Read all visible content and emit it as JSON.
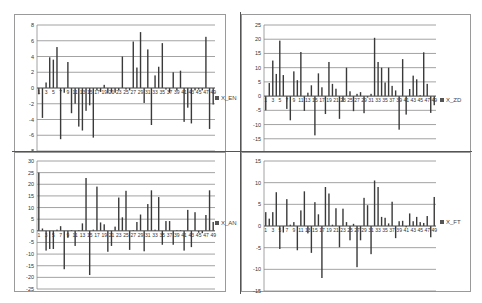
{
  "chart_data": [
    {
      "id": "x_en",
      "type": "bar",
      "title": "",
      "legend": "X_EN",
      "xlabel": "",
      "ylabel": "",
      "ylim": [
        -8,
        8
      ],
      "yticks": [
        -8,
        -6,
        -4,
        -2,
        0,
        2,
        4,
        6,
        8
      ],
      "grid": true,
      "legend_position": "right",
      "x_tick_labels": [
        "1",
        "3",
        "5",
        "7",
        "9",
        "11",
        "13",
        "15",
        "17",
        "19",
        "21",
        "23",
        "25",
        "27",
        "29",
        "31",
        "33",
        "35",
        "37",
        "39",
        "41",
        "43",
        "45",
        "47",
        "49"
      ],
      "categories": [
        1,
        2,
        3,
        4,
        5,
        6,
        7,
        8,
        9,
        10,
        11,
        12,
        13,
        14,
        15,
        16,
        17,
        18,
        19,
        20,
        21,
        22,
        23,
        24,
        25,
        26,
        27,
        28,
        29,
        30,
        31,
        32,
        33,
        34,
        35,
        36,
        37,
        38,
        39,
        40,
        41,
        42,
        43,
        44,
        45,
        46,
        47,
        48,
        49
      ],
      "values": [
        -0.8,
        -3.8,
        0.7,
        3.9,
        3.6,
        5.2,
        -6.5,
        -0.6,
        3.3,
        -3.2,
        -2.0,
        -4.9,
        -5.4,
        -2.9,
        -2.2,
        -6.3,
        -0.3,
        -0.5,
        0.4,
        -0.7,
        -0.6,
        -0.6,
        -0.3,
        4.0,
        -0.2,
        -0.3,
        5.9,
        2.6,
        7.1,
        -1.9,
        4.9,
        -4.7,
        1.6,
        2.7,
        5.7,
        -0.2,
        -0.6,
        2.0,
        -0.3,
        2.2,
        -4.3,
        -2.5,
        -4.5,
        -0.3,
        -0.2,
        -0.3,
        6.5,
        -5.2,
        -2.1
      ]
    },
    {
      "id": "x_zd",
      "type": "bar",
      "title": "",
      "legend": "X_ZD",
      "xlabel": "",
      "ylabel": "",
      "ylim": [
        -20,
        25
      ],
      "yticks": [
        -20,
        -15,
        -10,
        -5,
        0,
        5,
        10,
        15,
        20,
        25
      ],
      "grid": true,
      "legend_position": "right",
      "x_tick_labels": [
        "1",
        "3",
        "5",
        "7",
        "9",
        "11",
        "13",
        "15",
        "17",
        "19",
        "21",
        "23",
        "25",
        "27",
        "29",
        "31",
        "33",
        "35",
        "37",
        "39",
        "41",
        "43",
        "45",
        "47",
        "49"
      ],
      "categories": [
        1,
        2,
        3,
        4,
        5,
        6,
        7,
        8,
        9,
        10,
        11,
        12,
        13,
        14,
        15,
        16,
        17,
        18,
        19,
        20,
        21,
        22,
        23,
        24,
        25,
        26,
        27,
        28,
        29,
        30,
        31,
        32,
        33,
        34,
        35,
        36,
        37,
        38,
        39,
        40,
        41,
        42,
        43,
        44,
        45,
        46,
        47,
        48,
        49
      ],
      "values": [
        -5.0,
        4.6,
        12.5,
        7.8,
        19.5,
        7.4,
        -4.5,
        -8.5,
        8.7,
        5.6,
        15.5,
        -5.2,
        1.2,
        3.8,
        -13.8,
        8.0,
        3.1,
        -6.3,
        12.0,
        4.3,
        2.6,
        -8.0,
        -2.0,
        10.0,
        1.7,
        -5.3,
        0.8,
        1.4,
        -6.0,
        -0.5,
        0.8,
        20.5,
        12.0,
        10.0,
        4.8,
        10.0,
        3.6,
        2.0,
        -11.8,
        13.0,
        -6.5,
        2.5,
        7.2,
        5.9,
        0.3,
        15.4,
        4.3,
        -5.9,
        -3.2
      ]
    },
    {
      "id": "x_an",
      "type": "bar",
      "title": "",
      "legend": "X_AN",
      "xlabel": "",
      "ylabel": "",
      "ylim": [
        -25,
        30
      ],
      "yticks": [
        -25,
        -20,
        -15,
        -10,
        -5,
        0,
        5,
        10,
        15,
        20,
        25,
        30
      ],
      "grid": true,
      "legend_position": "right",
      "x_tick_labels": [
        "1",
        "3",
        "5",
        "7",
        "9",
        "11",
        "13",
        "15",
        "17",
        "19",
        "21",
        "23",
        "25",
        "27",
        "29",
        "31",
        "33",
        "35",
        "37",
        "39",
        "41",
        "43",
        "45",
        "47",
        "49"
      ],
      "categories": [
        1,
        2,
        3,
        4,
        5,
        6,
        7,
        8,
        9,
        10,
        11,
        12,
        13,
        14,
        15,
        16,
        17,
        18,
        19,
        20,
        21,
        22,
        23,
        24,
        25,
        26,
        27,
        28,
        29,
        30,
        31,
        32,
        33,
        34,
        35,
        36,
        37,
        38,
        39,
        40,
        41,
        42,
        43,
        44,
        45,
        46,
        47,
        48,
        49
      ],
      "values": [
        25.0,
        1.0,
        -8.5,
        -7.8,
        -7.8,
        0.5,
        2.0,
        -16.5,
        -3.0,
        0.3,
        -6.5,
        0.3,
        3.2,
        22.7,
        -19.0,
        0.5,
        19.0,
        3.6,
        2.8,
        -9.0,
        -6.5,
        1.8,
        14.3,
        5.8,
        17.2,
        -8.2,
        0.3,
        3.8,
        7.0,
        -8.8,
        11.5,
        17.4,
        0.5,
        14.5,
        -6.0,
        4.2,
        4.2,
        -6.0,
        0.3,
        0.3,
        -8.5,
        9.0,
        -7.0,
        8.0,
        -0.8,
        -1.0,
        6.8,
        17.4,
        3.8
      ]
    },
    {
      "id": "x_ft",
      "type": "bar",
      "title": "",
      "legend": "X_FT",
      "xlabel": "",
      "ylabel": "",
      "ylim": [
        -15,
        15
      ],
      "yticks": [
        -15,
        -10,
        -5,
        0,
        5,
        10,
        15
      ],
      "grid": true,
      "legend_position": "right",
      "x_tick_labels": [
        "1",
        "3",
        "5",
        "7",
        "9",
        "11",
        "13",
        "15",
        "17",
        "19",
        "21",
        "23",
        "25",
        "27",
        "29",
        "31",
        "33",
        "35",
        "37",
        "39",
        "41",
        "43",
        "45",
        "47",
        "49"
      ],
      "categories": [
        1,
        2,
        3,
        4,
        5,
        6,
        7,
        8,
        9,
        10,
        11,
        12,
        13,
        14,
        15,
        16,
        17,
        18,
        19,
        20,
        21,
        22,
        23,
        24,
        25,
        26,
        27,
        28,
        29,
        30,
        31,
        32,
        33,
        34,
        35,
        36,
        37,
        38,
        39,
        40,
        41,
        42,
        43,
        44,
        45,
        46,
        47,
        48,
        49
      ],
      "values": [
        3.2,
        1.7,
        3.2,
        7.8,
        -5.3,
        -1.5,
        6.2,
        0.3,
        0.9,
        -5.6,
        3.6,
        8.0,
        -1.7,
        -6.2,
        5.5,
        2.7,
        -12.0,
        9.0,
        7.5,
        0.3,
        4.1,
        -4.9,
        4.0,
        0.9,
        -3.3,
        0.5,
        -9.5,
        -3.3,
        6.5,
        4.8,
        -6.5,
        10.5,
        9.0,
        2.1,
        1.9,
        0.6,
        5.6,
        -2.8,
        1.1,
        1.2,
        -0.3,
        2.9,
        1.1,
        2.1,
        0.9,
        0.7,
        2.3,
        -2.6,
        6.7
      ]
    }
  ],
  "panels": [
    {
      "legend": "X_EN"
    },
    {
      "legend": "X_ZD"
    },
    {
      "legend": "X_AN"
    },
    {
      "legend": "X_FT"
    }
  ]
}
